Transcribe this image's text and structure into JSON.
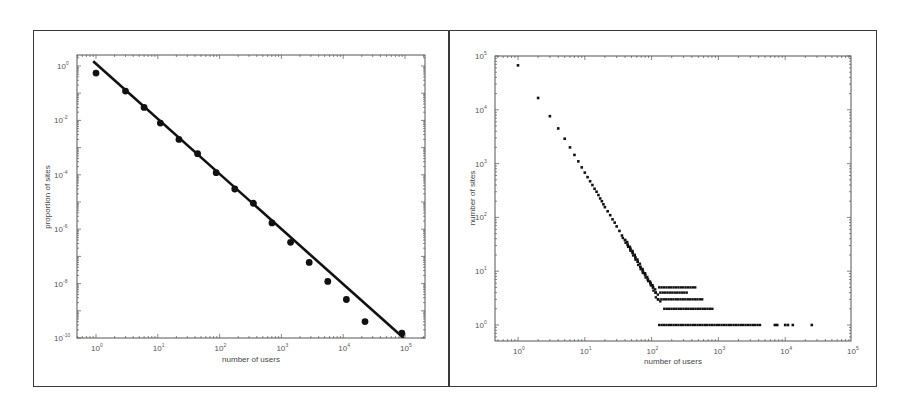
{
  "chart_data": [
    {
      "id": "left",
      "type": "scatter",
      "title": "",
      "xlabel": "number of users",
      "ylabel": "proportion of sites",
      "xscale": "log",
      "yscale": "log",
      "xlim": [
        0.5,
        200000
      ],
      "ylim": [
        1e-10,
        2
      ],
      "grid": false,
      "legend": null,
      "x_ticks": [
        {
          "base": "10",
          "exp": "0",
          "value": 1
        },
        {
          "base": "10",
          "exp": "1",
          "value": 10
        },
        {
          "base": "10",
          "exp": "2",
          "value": 100
        },
        {
          "base": "10",
          "exp": "3",
          "value": 1000
        },
        {
          "base": "10",
          "exp": "4",
          "value": 10000
        },
        {
          "base": "10",
          "exp": "5",
          "value": 100000
        }
      ],
      "y_ticks": [
        {
          "base": "10",
          "exp": "0",
          "value": 1
        },
        {
          "base": "10",
          "exp": "-2",
          "value": 0.01
        },
        {
          "base": "10",
          "exp": "-4",
          "value": 0.0001
        },
        {
          "base": "10",
          "exp": "-6",
          "value": 1e-06
        },
        {
          "base": "10",
          "exp": "-8",
          "value": 1e-08
        },
        {
          "base": "10",
          "exp": "-10",
          "value": 1e-10
        }
      ],
      "series": [
        {
          "name": "observed",
          "marker": "filled-circle",
          "x": [
            1,
            3,
            6,
            11,
            22,
            44,
            88,
            176,
            352,
            704,
            1408,
            2816,
            5632,
            11264,
            22528,
            89000
          ],
          "y": [
            0.55,
            0.12,
            0.03,
            0.008,
            0.002,
            0.0006,
            0.00012,
            3e-05,
            9e-06,
            1.7e-06,
            3.3e-07,
            6e-08,
            1.2e-08,
            2.6e-09,
            4e-10,
            1.5e-10
          ]
        },
        {
          "name": "power-law fit",
          "type": "line",
          "x": [
            0.9,
            95000
          ],
          "y": [
            1.5,
            1e-10
          ]
        }
      ]
    },
    {
      "id": "right",
      "type": "scatter",
      "title": "",
      "xlabel": "number of users",
      "ylabel": "number of sites",
      "xscale": "log",
      "yscale": "log",
      "xlim": [
        0.7,
        100000
      ],
      "ylim": [
        0.7,
        100000
      ],
      "grid": false,
      "legend": null,
      "x_ticks": [
        {
          "base": "10",
          "exp": "0",
          "value": 1
        },
        {
          "base": "10",
          "exp": "1",
          "value": 10
        },
        {
          "base": "10",
          "exp": "2",
          "value": 100
        },
        {
          "base": "10",
          "exp": "3",
          "value": 1000
        },
        {
          "base": "10",
          "exp": "4",
          "value": 10000
        },
        {
          "base": "10",
          "exp": "5",
          "value": 100000
        }
      ],
      "y_ticks": [
        {
          "base": "10",
          "exp": "0",
          "value": 1
        },
        {
          "base": "10",
          "exp": "1",
          "value": 10
        },
        {
          "base": "10",
          "exp": "2",
          "value": 100
        },
        {
          "base": "10",
          "exp": "3",
          "value": 1000
        },
        {
          "base": "10",
          "exp": "4",
          "value": 10000
        },
        {
          "base": "10",
          "exp": "5",
          "value": 100000
        }
      ],
      "series": [
        {
          "name": "sites per user count",
          "marker": "small-square",
          "description": "Power-law decay from ~67000 sites at 1 user down to count 1 at ~130+ users; horizontal bands at counts 1-5 extending to ~25000 users",
          "x": [
            1,
            2,
            3,
            4,
            5,
            6,
            7,
            8,
            9,
            10,
            11,
            12,
            13,
            14,
            15,
            16,
            17,
            18,
            19,
            20,
            22,
            24,
            26,
            28,
            30,
            33,
            36,
            40,
            44,
            48,
            52,
            57,
            62,
            68,
            74,
            80,
            88,
            96,
            105,
            115,
            125
          ],
          "y": [
            67000,
            16600,
            7600,
            4500,
            2900,
            2000,
            1450,
            1100,
            850,
            680,
            560,
            470,
            400,
            340,
            300,
            260,
            225,
            200,
            175,
            155,
            130,
            110,
            92,
            80,
            68,
            56,
            46,
            38,
            31,
            26,
            22,
            18,
            15,
            12,
            10,
            8.5,
            7,
            6,
            5,
            4,
            3
          ]
        },
        {
          "name": "band count 5",
          "y_value": 5,
          "x_range": [
            130,
            450
          ]
        },
        {
          "name": "band count 4",
          "y_value": 4,
          "x_range": [
            135,
            360
          ]
        },
        {
          "name": "band count 3",
          "y_value": 3,
          "x_range": [
            140,
            600
          ]
        },
        {
          "name": "band count 2",
          "y_value": 2,
          "x_range": [
            155,
            820
          ]
        },
        {
          "name": "band count 1",
          "y_value": 1,
          "x_range": [
            130,
            4500
          ],
          "isolated_x": [
            7000,
            7600,
            10000,
            11000,
            13000,
            25000
          ]
        }
      ]
    }
  ]
}
